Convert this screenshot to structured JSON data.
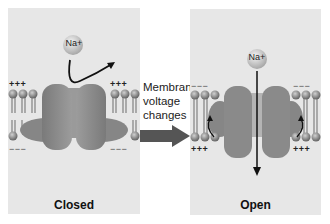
{
  "panels": {
    "closed": {
      "label": "Closed",
      "ion": "Na+",
      "top_charges": "+ + +",
      "bottom_charges": "− − −"
    },
    "open": {
      "label": "Open",
      "ion": "Na+",
      "top_charges": "− − −",
      "bottom_charges": "+ + +"
    }
  },
  "transition": {
    "line1": "Membrane",
    "line2": "voltage",
    "line3": "changes",
    "arrow": "right-arrow"
  },
  "colors": {
    "panel_bg": "#e7e7e7",
    "protein": "#8a8a8a",
    "protein_dark": "#6e6e6e",
    "lipid_head": "#9a9a9a",
    "arrow": "#555555"
  }
}
